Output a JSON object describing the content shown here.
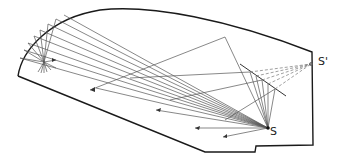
{
  "diagram": {
    "type": "acoustic ray-tracing section",
    "labels": {
      "source": "S",
      "image_source": "S'"
    },
    "colors": {
      "outline": "#1a1a1a",
      "ray": "#555555",
      "dashed_ray": "#777777",
      "background": "#ffffff"
    }
  }
}
